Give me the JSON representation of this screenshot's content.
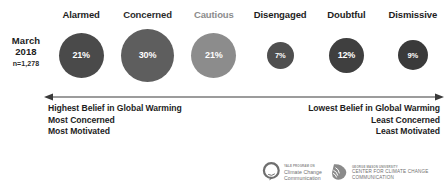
{
  "chart_data": {
    "type": "bar",
    "categories": [
      "Alarmed",
      "Concerned",
      "Cautious",
      "Disengaged",
      "Doubtful",
      "Dismissive"
    ],
    "values": [
      21,
      30,
      21,
      7,
      12,
      9
    ],
    "value_labels": [
      "21%",
      "30%",
      "21%",
      "7%",
      "12%",
      "9%"
    ],
    "unit": "%",
    "xlabel": "",
    "ylabel": "",
    "legend": "none",
    "grid": false,
    "note": "Proportional circle (bubble) sizes encode segment share of population",
    "colors": [
      "#4a4a4a",
      "#5e5e5e",
      "#8c8c8c",
      "#4f4f4f",
      "#3f3f3f",
      "#3a3a3a"
    ]
  },
  "period": {
    "month": "March",
    "year": "2018",
    "sample_size": "n=1,278"
  },
  "segments": [
    {
      "label": "Alarmed",
      "value": "21%",
      "diameter": 45,
      "color": "#4a4a4a",
      "label_color": "#1d1d1d"
    },
    {
      "label": "Concerned",
      "value": "30%",
      "diameter": 53,
      "color": "#5e5e5e",
      "label_color": "#2b2b2b"
    },
    {
      "label": "Cautious",
      "value": "21%",
      "diameter": 45,
      "color": "#8c8c8c",
      "label_color": "#8c8c8c"
    },
    {
      "label": "Disengaged",
      "value": "7%",
      "diameter": 27,
      "color": "#4f4f4f",
      "label_color": "#1d1d1d"
    },
    {
      "label": "Doubtful",
      "value": "12%",
      "diameter": 35,
      "color": "#3f3f3f",
      "label_color": "#1d1d1d"
    },
    {
      "label": "Dismissive",
      "value": "9%",
      "diameter": 30,
      "color": "#3a3a3a",
      "label_color": "#1d1d1d"
    }
  ],
  "axis": {
    "left_descriptor": [
      "Highest Belief in Global Warming",
      "Most Concerned",
      "Most Motivated"
    ],
    "right_descriptor": [
      "Lowest Belief in Global Warming",
      "Least Concerned",
      "Least Motivated"
    ]
  },
  "descriptors": {
    "left_line1": "Highest Belief in Global Warming",
    "left_line2": "Most Concerned",
    "left_line3": "Most Motivated",
    "right_line1": "Lowest Belief in Global Warming",
    "right_line2": "Least Concerned",
    "right_line3": "Least Motivated"
  },
  "logos": [
    {
      "sup": "Yale Program on",
      "line1": "Climate Change",
      "line2": "Communication",
      "mark": "speech-bubble-icon"
    },
    {
      "sup": "George Mason University",
      "line1": "Center for Climate Change",
      "line2": "Communication",
      "mark": "mason-shield-icon"
    }
  ],
  "colors": {
    "axis": "#3a3a3a",
    "text": "#1d1d1d",
    "logo_gray": "#6f6f6f"
  }
}
